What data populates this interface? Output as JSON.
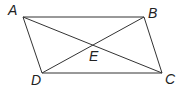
{
  "diagram": {
    "type": "parallelogram-with-diagonals",
    "stroke_color": "#333333",
    "vertices": [
      {
        "label": "A",
        "x": 23,
        "y": 17,
        "lx": 8,
        "ly": 15
      },
      {
        "label": "B",
        "x": 144,
        "y": 17,
        "lx": 148,
        "ly": 18
      },
      {
        "label": "C",
        "x": 162,
        "y": 73,
        "lx": 165,
        "ly": 84
      },
      {
        "label": "D",
        "x": 42,
        "y": 73,
        "lx": 31,
        "ly": 85
      }
    ],
    "intersection": {
      "label": "E",
      "x": 93,
      "y": 44,
      "lx": 89,
      "ly": 61
    },
    "edges": [
      [
        "A",
        "B"
      ],
      [
        "B",
        "C"
      ],
      [
        "C",
        "D"
      ],
      [
        "D",
        "A"
      ]
    ],
    "diagonals": [
      [
        "A",
        "C"
      ],
      [
        "B",
        "D"
      ]
    ]
  }
}
